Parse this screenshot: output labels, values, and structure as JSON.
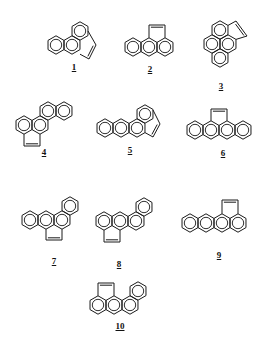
{
  "figure": {
    "stroke_color": "#1a1a1a",
    "background": "#ffffff",
    "ring_radius": 9.2
  },
  "structures": [
    {
      "id": "1",
      "label": "1",
      "label_pos": [
        74,
        68
      ],
      "rings": [
        [
          56,
          45
        ],
        [
          72,
          45
        ],
        [
          80,
          31
        ]
      ],
      "bridge": [
        [
          80,
          54.2
        ],
        [
          89,
          59
        ],
        [
          96,
          45
        ],
        [
          88,
          31
        ]
      ]
    },
    {
      "id": "2",
      "label": "2",
      "label_pos": [
        150,
        70
      ],
      "rings": [
        [
          133,
          47
        ],
        [
          149,
          47
        ],
        [
          165,
          47
        ]
      ],
      "bridge": [
        [
          149,
          37.8
        ],
        [
          149,
          25
        ],
        [
          165,
          25
        ],
        [
          165,
          37.8
        ]
      ]
    },
    {
      "id": "3",
      "label": "3",
      "label_pos": [
        221,
        87
      ],
      "rings": [
        [
          220,
          30
        ],
        [
          212,
          44
        ],
        [
          228,
          44
        ],
        [
          220,
          58
        ]
      ],
      "bridge": [
        [
          228,
          25.4
        ],
        [
          236,
          21
        ],
        [
          247,
          36
        ],
        [
          236,
          39.4
        ]
      ]
    },
    {
      "id": "4",
      "label": "4",
      "label_pos": [
        44,
        153
      ],
      "rings": [
        [
          24,
          125
        ],
        [
          40,
          125
        ],
        [
          48,
          111
        ],
        [
          64,
          111
        ]
      ],
      "bridge": [
        [
          24,
          134.2
        ],
        [
          24,
          146
        ],
        [
          40,
          146
        ],
        [
          40,
          134.2
        ]
      ]
    },
    {
      "id": "5",
      "label": "5",
      "label_pos": [
        130,
        151
      ],
      "rings": [
        [
          105,
          128
        ],
        [
          121,
          128
        ],
        [
          137,
          128
        ],
        [
          145,
          114
        ]
      ],
      "bridge": [
        [
          145,
          132.6
        ],
        [
          153,
          137
        ],
        [
          160,
          124
        ],
        [
          153,
          110
        ]
      ]
    },
    {
      "id": "6",
      "label": "6",
      "label_pos": [
        223,
        154
      ],
      "rings": [
        [
          195,
          130
        ],
        [
          211,
          130
        ],
        [
          227,
          130
        ],
        [
          243,
          130
        ]
      ],
      "bridge": [
        [
          211,
          120.8
        ],
        [
          211,
          109
        ],
        [
          227,
          109
        ],
        [
          227,
          120.8
        ]
      ]
    },
    {
      "id": "7",
      "label": "7",
      "label_pos": [
        54,
        262
      ],
      "rings": [
        [
          30,
          220
        ],
        [
          46,
          220
        ],
        [
          62,
          220
        ],
        [
          70,
          206
        ]
      ],
      "bridge": [
        [
          46,
          229.2
        ],
        [
          46,
          240
        ],
        [
          62,
          240
        ],
        [
          62,
          229.2
        ]
      ]
    },
    {
      "id": "8",
      "label": "8",
      "label_pos": [
        119,
        265
      ],
      "rings": [
        [
          104,
          221
        ],
        [
          120,
          221
        ],
        [
          136,
          221
        ],
        [
          144,
          207
        ]
      ],
      "bridge": [
        [
          104,
          230.2
        ],
        [
          104,
          242
        ],
        [
          120,
          242
        ],
        [
          120,
          230.2
        ]
      ]
    },
    {
      "id": "9",
      "label": "9",
      "label_pos": [
        219,
        256
      ],
      "rings": [
        [
          190,
          223
        ],
        [
          206,
          223
        ],
        [
          222,
          223
        ],
        [
          238,
          223
        ]
      ],
      "bridge": [
        [
          222,
          213.8
        ],
        [
          222,
          200
        ],
        [
          238,
          200
        ],
        [
          238,
          213.8
        ]
      ]
    },
    {
      "id": "10",
      "label": "10",
      "label_pos": [
        120,
        327
      ],
      "rings": [
        [
          98,
          305
        ],
        [
          114,
          305
        ],
        [
          130,
          305
        ],
        [
          138,
          291
        ]
      ],
      "bridge": [
        [
          98,
          295.8
        ],
        [
          98,
          283
        ],
        [
          114,
          283
        ],
        [
          114,
          295.8
        ]
      ]
    }
  ]
}
